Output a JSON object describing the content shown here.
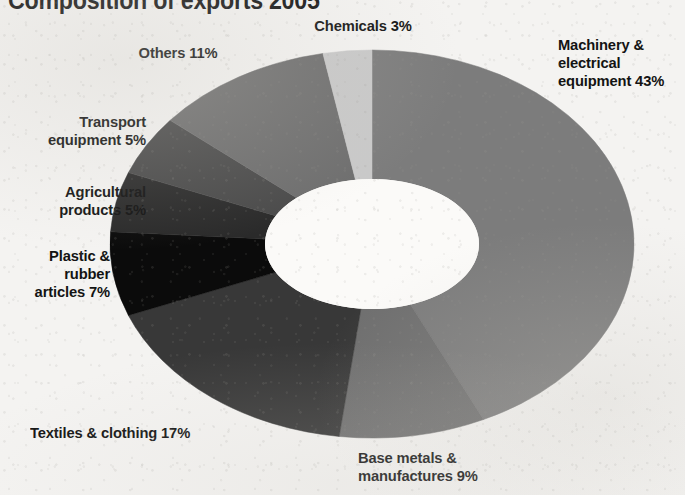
{
  "chart_data": {
    "type": "pie",
    "variant": "donut",
    "title": "Composition of exports 2005",
    "title_visible_partial": true,
    "xlabel": "",
    "ylabel": "",
    "units": "percent",
    "total": 100,
    "legend": "labels-outside",
    "grid": false,
    "start_angle_deg": 0,
    "direction": "clockwise",
    "categories": [
      "Machinery & electrical equipment",
      "Base metals & manufactures",
      "Textiles & clothing",
      "Plastic & rubber articles",
      "Agricultural products",
      "Transport equipment",
      "Others",
      "Chemicals"
    ],
    "values": [
      43,
      9,
      17,
      7,
      5,
      5,
      11,
      3
    ],
    "slices": [
      {
        "name": "Machinery & electrical equipment",
        "value": 43,
        "label": "Machinery & electrical equipment 43%",
        "color": "#7c7c7c"
      },
      {
        "name": "Base metals & manufactures",
        "value": 9,
        "label": "Base metals & manufactures 9%",
        "color": "#6f6f6f"
      },
      {
        "name": "Textiles & clothing",
        "value": 17,
        "label": "Textiles & clothing 17%",
        "color": "#383838"
      },
      {
        "name": "Plastic & rubber articles",
        "value": 7,
        "label": "Plastic & rubber articles 7%",
        "color": "#0b0b0b"
      },
      {
        "name": "Agricultural products",
        "value": 5,
        "label": "Agricultural products 5%",
        "color": "#2a2a2a"
      },
      {
        "name": "Transport equipment",
        "value": 5,
        "label": "Transport equipment 5%",
        "color": "#4a4a4a"
      },
      {
        "name": "Others",
        "value": 11,
        "label": "Others 11%",
        "color": "#6e6e6e"
      },
      {
        "name": "Chemicals",
        "value": 3,
        "label": "Chemicals 3%",
        "color": "#c9c9c9"
      }
    ]
  },
  "labels": {
    "machinery_line1": "Machinery &",
    "machinery_line2": "electrical",
    "machinery_line3": "equipment 43%",
    "chemicals": "Chemicals 3%",
    "others": "Others 11%",
    "transport_line1": "Transport",
    "transport_line2": "equipment 5%",
    "agricultural_line1": "Agricultural",
    "agricultural_line2": "products 5%",
    "plastic_line1": "Plastic &",
    "plastic_line2": "rubber",
    "plastic_line3": "articles 7%",
    "textiles": "Textiles & clothing 17%",
    "basemetals_line1": "Base metals &",
    "basemetals_line2": "manufactures 9%"
  },
  "colors": {
    "background": "#f4f3f1",
    "text": "#131313",
    "slice_light": "#c9c9c9",
    "slice_mid": "#7c7c7c",
    "slice_dark": "#383838",
    "slice_black": "#0b0b0b",
    "hole": "#fbfaf8"
  }
}
